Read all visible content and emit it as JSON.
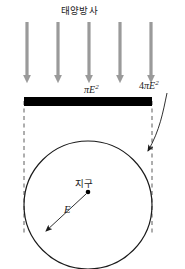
{
  "figure": {
    "title": "태양방사",
    "earth_label": "지구",
    "labels": {
      "disk_area": {
        "coefficient": "",
        "pi": "π",
        "symbol": "E",
        "exponent": "2"
      },
      "sphere_area": {
        "coefficient": "4",
        "pi": "π",
        "symbol": "E",
        "exponent": "2"
      },
      "radius": "E"
    },
    "colors": {
      "ray_gray": "#9a9a9a",
      "bar_black": "#000000",
      "outline": "#1a1a1a",
      "background": "#ffffff"
    },
    "rays": {
      "count": 5,
      "x_positions": [
        27,
        58,
        89,
        120,
        151
      ],
      "top": 22,
      "tip": 82
    },
    "bar": {
      "x1": 24,
      "x2": 152,
      "y": 97,
      "thickness": 9
    },
    "circle": {
      "cx": 88,
      "cy": 205,
      "r": 64
    },
    "dashed_guides": [
      24,
      152
    ],
    "center_dot": {
      "x": 88,
      "y": 192
    }
  }
}
